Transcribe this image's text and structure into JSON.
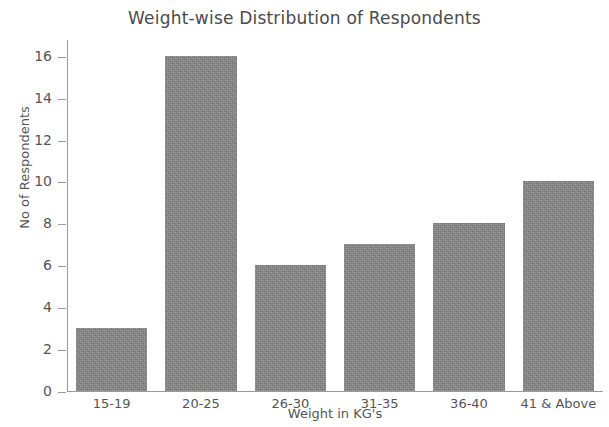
{
  "chart_data": {
    "type": "bar",
    "title": "Weight-wise Distribution of Respondents",
    "xlabel": "Weight in KG's",
    "ylabel": "No of Respondents",
    "categories": [
      "15-19",
      "20-25",
      "26-30",
      "31-35",
      "36-40",
      "41 & Above"
    ],
    "values": [
      3,
      16,
      6,
      7,
      8,
      10
    ],
    "yticks": [
      0,
      2,
      4,
      6,
      8,
      10,
      12,
      14,
      16
    ],
    "ylim": [
      0,
      16.8
    ],
    "grid": false,
    "legend": false,
    "bar_color": "#868686",
    "text_color": "#555555",
    "background_color": "#ffffff"
  }
}
